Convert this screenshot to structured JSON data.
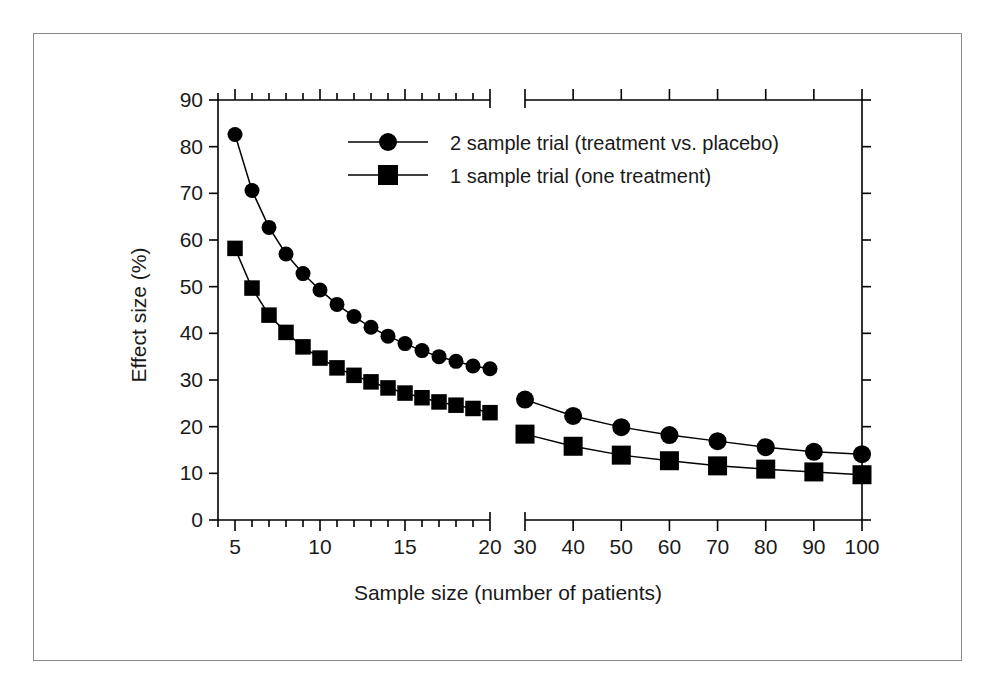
{
  "figure": {
    "frame_color": "#8a8a8a",
    "background": "#ffffff",
    "ink_color": "#000000"
  },
  "chart_data": {
    "type": "line",
    "title": "",
    "xlabel": "Sample size (number of patients)",
    "ylabel": "Effect size (%)",
    "ylim": [
      0,
      90
    ],
    "ytick_labels": [
      "0",
      "10",
      "20",
      "30",
      "40",
      "50",
      "60",
      "70",
      "80",
      "90"
    ],
    "yticks": [
      0,
      10,
      20,
      30,
      40,
      50,
      60,
      70,
      80,
      90
    ],
    "grid": false,
    "broken_x_axis": true,
    "x_segments": [
      {
        "name": "left-segment",
        "range": [
          4,
          20
        ],
        "tick_labels": [
          "5",
          "10",
          "15",
          "20"
        ],
        "ticks": [
          5,
          10,
          15,
          20
        ],
        "minor_ticks": [
          4,
          5,
          6,
          7,
          8,
          9,
          10,
          11,
          12,
          13,
          14,
          15,
          16,
          17,
          18,
          19,
          20
        ]
      },
      {
        "name": "right-segment",
        "range": [
          30,
          100
        ],
        "tick_labels": [
          "30",
          "40",
          "50",
          "60",
          "70",
          "80",
          "90",
          "100"
        ],
        "ticks": [
          30,
          40,
          50,
          60,
          70,
          80,
          90,
          100
        ],
        "minor_ticks": [
          30,
          40,
          50,
          60,
          70,
          80,
          90,
          100
        ]
      }
    ],
    "legend": {
      "position": "top-center",
      "entries": [
        {
          "label": "2 sample trial (treatment vs. placebo)",
          "marker": "circle"
        },
        {
          "label": "1 sample trial (one treatment)",
          "marker": "square"
        }
      ]
    },
    "series": [
      {
        "name": "2 sample trial (treatment vs. placebo)",
        "marker": "circle",
        "x": [
          5,
          6,
          7,
          8,
          9,
          10,
          11,
          12,
          13,
          14,
          15,
          16,
          17,
          18,
          19,
          20,
          30,
          40,
          50,
          60,
          70,
          80,
          90,
          100
        ],
        "values": [
          82.6,
          70.6,
          62.7,
          57.0,
          52.8,
          49.3,
          46.2,
          43.6,
          41.3,
          39.4,
          37.8,
          36.3,
          35.0,
          34.0,
          33.0,
          32.4,
          25.8,
          22.3,
          19.9,
          18.2,
          16.9,
          15.6,
          14.6,
          14.1
        ]
      },
      {
        "name": "1 sample trial (one treatment)",
        "marker": "square",
        "x": [
          5,
          6,
          7,
          8,
          9,
          10,
          11,
          12,
          13,
          14,
          15,
          16,
          17,
          18,
          19,
          20,
          30,
          40,
          50,
          60,
          70,
          80,
          90,
          100
        ],
        "values": [
          58.2,
          49.7,
          43.9,
          40.2,
          37.1,
          34.7,
          32.6,
          31.0,
          29.6,
          28.3,
          27.2,
          26.2,
          25.3,
          24.6,
          23.9,
          23.0,
          18.4,
          15.8,
          13.9,
          12.7,
          11.6,
          10.9,
          10.3,
          9.7
        ]
      }
    ]
  }
}
